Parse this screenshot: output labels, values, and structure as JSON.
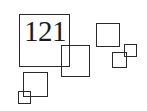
{
  "label": {
    "text": "121"
  },
  "colors": {
    "stroke": "#2a2a2a",
    "text": "#1a1a1a",
    "background": "#ffffff"
  },
  "squares": [
    {
      "name": "large-square",
      "x": 19,
      "y": 14,
      "w": 51,
      "h": 53
    },
    {
      "name": "overlap-square",
      "x": 61,
      "y": 45,
      "w": 29,
      "h": 32
    },
    {
      "name": "lower-left-square",
      "x": 23,
      "y": 72,
      "w": 25,
      "h": 25
    },
    {
      "name": "tiny-corner-square",
      "x": 18,
      "y": 91,
      "w": 13,
      "h": 13
    },
    {
      "name": "right-square",
      "x": 96,
      "y": 23,
      "w": 24,
      "h": 24
    },
    {
      "name": "small-square-a",
      "x": 112,
      "y": 52,
      "w": 15,
      "h": 16
    },
    {
      "name": "small-square-b",
      "x": 124,
      "y": 44,
      "w": 13,
      "h": 13
    }
  ]
}
